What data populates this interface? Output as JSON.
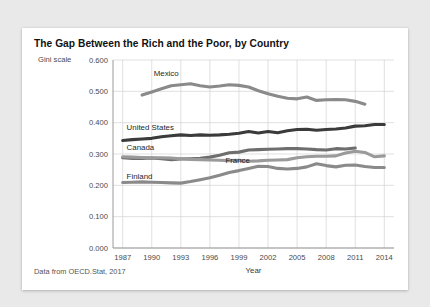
{
  "card": {
    "title": "The Gap Between the Rich and the Poor, by Country",
    "source_note": "Data from OECD.Stat, 2017"
  },
  "chart_data": {
    "type": "line",
    "title": "The Gap Between the Rich and the Poor, by Country",
    "xlabel": "Year",
    "ylabel": "Gini scale",
    "xlim": [
      1986,
      2015
    ],
    "ylim": [
      0.0,
      0.6
    ],
    "grid": true,
    "legend_position": "inline-labels",
    "ytick_labels": [
      "0.000",
      "0.100",
      "0.200",
      "0.300",
      "0.400",
      "0.500",
      "0.600"
    ],
    "ytick_values": [
      0.0,
      0.1,
      0.2,
      0.3,
      0.4,
      0.5,
      0.6
    ],
    "xtick_labels": [
      "1987",
      "1990",
      "1993",
      "1996",
      "1999",
      "2002",
      "2005",
      "2008",
      "2011",
      "2014"
    ],
    "xtick_values": [
      1987,
      1990,
      1993,
      1996,
      1999,
      2002,
      2005,
      2008,
      2011,
      2014
    ],
    "series": [
      {
        "name": "Mexico",
        "color": "#8a8a8a",
        "label_x": 1990.2,
        "label_y": 0.555,
        "x": [
          1989,
          1990,
          1991,
          1992,
          1993,
          1994,
          1995,
          1996,
          1997,
          1998,
          1999,
          2000,
          2001,
          2002,
          2003,
          2004,
          2005,
          2006,
          2007,
          2008,
          2009,
          2010,
          2011,
          2012
        ],
        "values": [
          0.488,
          0.498,
          0.508,
          0.518,
          0.521,
          0.524,
          0.518,
          0.514,
          0.517,
          0.521,
          0.519,
          0.514,
          0.502,
          0.492,
          0.484,
          0.478,
          0.476,
          0.482,
          0.471,
          0.473,
          0.474,
          0.473,
          0.468,
          0.459
        ]
      },
      {
        "name": "United States",
        "color": "#3b3b3b",
        "label_x": 1987.4,
        "label_y": 0.382,
        "x": [
          1987,
          1988,
          1989,
          1990,
          1991,
          1992,
          1993,
          1994,
          1995,
          1996,
          1997,
          1998,
          1999,
          2000,
          2001,
          2002,
          2003,
          2004,
          2005,
          2006,
          2007,
          2008,
          2009,
          2010,
          2011,
          2012,
          2013,
          2014
        ],
        "values": [
          0.343,
          0.346,
          0.348,
          0.35,
          0.355,
          0.358,
          0.361,
          0.359,
          0.361,
          0.36,
          0.361,
          0.363,
          0.366,
          0.372,
          0.367,
          0.372,
          0.368,
          0.374,
          0.378,
          0.379,
          0.376,
          0.378,
          0.38,
          0.383,
          0.389,
          0.39,
          0.394,
          0.394
        ]
      },
      {
        "name": "Canada",
        "color": "#6e6e6e",
        "label_x": 1987.4,
        "label_y": 0.318,
        "x": [
          1987,
          1988,
          1989,
          1990,
          1991,
          1992,
          1993,
          1994,
          1995,
          1996,
          1997,
          1998,
          1999,
          2000,
          2001,
          2002,
          2003,
          2004,
          2005,
          2006,
          2007,
          2008,
          2009,
          2010,
          2011
        ],
        "values": [
          0.288,
          0.286,
          0.286,
          0.287,
          0.285,
          0.282,
          0.284,
          0.285,
          0.286,
          0.29,
          0.296,
          0.304,
          0.306,
          0.313,
          0.314,
          0.315,
          0.316,
          0.317,
          0.317,
          0.316,
          0.314,
          0.313,
          0.317,
          0.316,
          0.319
        ]
      },
      {
        "name": "France",
        "color": "#9a9a9a",
        "label_x": 1997.6,
        "label_y": 0.277,
        "x": [
          1987,
          1988,
          1989,
          1990,
          1991,
          1992,
          1993,
          1994,
          1995,
          1996,
          1997,
          1998,
          1999,
          2000,
          2001,
          2002,
          2003,
          2004,
          2005,
          2006,
          2007,
          2008,
          2009,
          2010,
          2011,
          2012,
          2013,
          2014
        ],
        "values": [
          0.291,
          0.29,
          0.289,
          0.288,
          0.288,
          0.287,
          0.285,
          0.283,
          0.282,
          0.281,
          0.28,
          0.279,
          0.28,
          0.277,
          0.278,
          0.28,
          0.281,
          0.282,
          0.288,
          0.291,
          0.293,
          0.293,
          0.294,
          0.303,
          0.309,
          0.305,
          0.291,
          0.294
        ]
      },
      {
        "name": "Finland",
        "color": "#8a8a8a",
        "label_x": 1987.4,
        "label_y": 0.228,
        "x": [
          1987,
          1988,
          1989,
          1990,
          1991,
          1992,
          1993,
          1994,
          1995,
          1996,
          1997,
          1998,
          1999,
          2000,
          2001,
          2002,
          2003,
          2004,
          2005,
          2006,
          2007,
          2008,
          2009,
          2010,
          2011,
          2012,
          2013,
          2014
        ],
        "values": [
          0.209,
          0.21,
          0.211,
          0.21,
          0.209,
          0.208,
          0.207,
          0.212,
          0.218,
          0.224,
          0.232,
          0.241,
          0.247,
          0.254,
          0.261,
          0.26,
          0.254,
          0.252,
          0.254,
          0.259,
          0.269,
          0.263,
          0.259,
          0.264,
          0.265,
          0.26,
          0.257,
          0.257
        ]
      }
    ]
  }
}
